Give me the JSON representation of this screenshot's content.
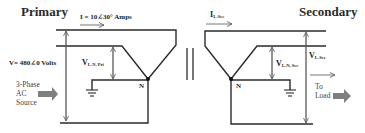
{
  "diagram": {
    "primary": {
      "title": "Primary",
      "current_label": "I = 10∠30° Amps",
      "voltage_label": "V= 480∠0 Volts",
      "vln_symbol": "V",
      "vln_subscript": "L-N, Pri",
      "neutral_label": "N",
      "source_label_lines": [
        "3-Phase",
        "AC",
        "Source"
      ]
    },
    "secondary": {
      "title": "Secondary",
      "current_symbol": "I",
      "current_subscript": "L-Sec",
      "vln_symbol": "V",
      "vln_subscript": "L-N, Sec",
      "vll_symbol": "V",
      "vll_subscript": "L-Sec",
      "neutral_label": "N",
      "load_label_lines": [
        "To",
        "Load"
      ]
    },
    "transformer_core_symbol": "||",
    "colors": {
      "wire": "#2b2b2b",
      "arrow_thin": "#555555",
      "block_arrow": "#7f7f7f",
      "text": "#222222"
    }
  }
}
